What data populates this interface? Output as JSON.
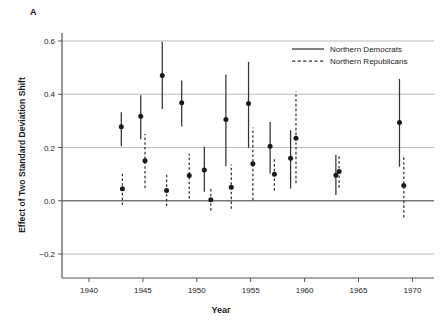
{
  "panel": {
    "label": "A"
  },
  "chart_data": {
    "type": "scatter",
    "title": "",
    "xlabel": "Year",
    "ylabel": "Effect of Two Standard Deviation Shift",
    "xlim": [
      1937.5,
      1972.0
    ],
    "ylim": [
      -0.29,
      0.63
    ],
    "xticks": [
      1940,
      1945,
      1950,
      1955,
      1960,
      1965,
      1970
    ],
    "xticklabels": [
      "1940",
      "1945",
      "1950",
      "1955",
      "1960",
      "1965",
      "1970"
    ],
    "yticks": [
      -0.2,
      0.0,
      0.2,
      0.4,
      0.6
    ],
    "yticklabels": [
      "−0.2",
      "0.0",
      "0.2",
      "0.4",
      "0.6"
    ],
    "grid": "horizontal",
    "zero_line": true,
    "legend_position": "top-right",
    "marker": "filled-circle",
    "errorbar": "vertical-ci",
    "series": [
      {
        "name": "Northern Democrats",
        "linestyle": "solid",
        "color": "#333333",
        "points": [
          {
            "x": 1943.0,
            "y": 0.278,
            "lo": 0.205,
            "hi": 0.332
          },
          {
            "x": 1944.8,
            "y": 0.317,
            "lo": 0.231,
            "hi": 0.396
          },
          {
            "x": 1946.8,
            "y": 0.47,
            "lo": 0.345,
            "hi": 0.597
          },
          {
            "x": 1948.6,
            "y": 0.368,
            "lo": 0.279,
            "hi": 0.452
          },
          {
            "x": 1950.7,
            "y": 0.116,
            "lo": 0.034,
            "hi": 0.203
          },
          {
            "x": 1952.7,
            "y": 0.305,
            "lo": 0.13,
            "hi": 0.474
          },
          {
            "x": 1954.8,
            "y": 0.365,
            "lo": 0.198,
            "hi": 0.522
          },
          {
            "x": 1956.8,
            "y": 0.205,
            "lo": 0.102,
            "hi": 0.296
          },
          {
            "x": 1958.7,
            "y": 0.16,
            "lo": 0.046,
            "hi": 0.265
          },
          {
            "x": 1962.9,
            "y": 0.096,
            "lo": 0.022,
            "hi": 0.173
          },
          {
            "x": 1968.8,
            "y": 0.294,
            "lo": 0.128,
            "hi": 0.458
          }
        ]
      },
      {
        "name": "Northern Republicans",
        "linestyle": "dashed",
        "color": "#333333",
        "points": [
          {
            "x": 1943.1,
            "y": 0.045,
            "lo": -0.016,
            "hi": 0.11
          },
          {
            "x": 1945.2,
            "y": 0.15,
            "lo": 0.048,
            "hi": 0.251
          },
          {
            "x": 1947.2,
            "y": 0.039,
            "lo": -0.02,
            "hi": 0.104
          },
          {
            "x": 1949.3,
            "y": 0.095,
            "lo": 0.008,
            "hi": 0.177
          },
          {
            "x": 1951.3,
            "y": 0.004,
            "lo": -0.037,
            "hi": 0.049
          },
          {
            "x": 1953.2,
            "y": 0.051,
            "lo": -0.03,
            "hi": 0.136
          },
          {
            "x": 1955.2,
            "y": 0.139,
            "lo": 0.002,
            "hi": 0.275
          },
          {
            "x": 1957.2,
            "y": 0.1,
            "lo": 0.038,
            "hi": 0.163
          },
          {
            "x": 1959.2,
            "y": 0.235,
            "lo": 0.066,
            "hi": 0.41
          },
          {
            "x": 1963.2,
            "y": 0.11,
            "lo": 0.049,
            "hi": 0.172
          },
          {
            "x": 1969.2,
            "y": 0.057,
            "lo": -0.063,
            "hi": 0.172
          }
        ]
      }
    ]
  },
  "colors": {
    "axis": "#555555",
    "grid": "#bbbbbb",
    "zero": "#777777",
    "marker": "#1a1a1a",
    "text": "#1a1a1a",
    "background": "#ffffff"
  }
}
